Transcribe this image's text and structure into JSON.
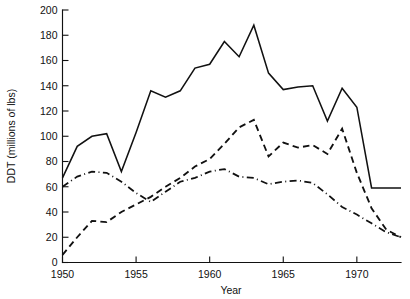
{
  "chart_data": {
    "type": "line",
    "title": "",
    "xlabel": "Year",
    "ylabel": "DDT (millions of lbs)",
    "xlim": [
      1950,
      1973
    ],
    "ylim": [
      0,
      200
    ],
    "grid": false,
    "legend_position": "none",
    "x_ticks": [
      1950,
      1955,
      1960,
      1965,
      1970
    ],
    "x_tick_labels": [
      "1950",
      "1955",
      "1960",
      "1965",
      "1970"
    ],
    "y_ticks": [
      0,
      20,
      40,
      60,
      80,
      100,
      120,
      140,
      160,
      180,
      200
    ],
    "y_tick_labels": [
      "0",
      "20",
      "40",
      "60",
      "80",
      "100",
      "120",
      "140",
      "160",
      "180",
      "200"
    ],
    "x": [
      1950,
      1951,
      1952,
      1953,
      1954,
      1955,
      1956,
      1957,
      1958,
      1959,
      1960,
      1961,
      1962,
      1963,
      1964,
      1965,
      1966,
      1967,
      1968,
      1969,
      1970,
      1971,
      1972,
      1973
    ],
    "series": [
      {
        "name": "Total production",
        "style": "solid",
        "values": [
          67,
          92,
          100,
          102,
          72,
          103,
          136,
          131,
          136,
          154,
          157,
          175,
          163,
          188,
          150,
          137,
          139,
          140,
          112,
          138,
          123,
          59,
          59,
          59
        ]
      },
      {
        "name": "Exports",
        "style": "dashed",
        "values": [
          6,
          20,
          33,
          32,
          40,
          46,
          52,
          60,
          67,
          76,
          82,
          94,
          107,
          113,
          84,
          95,
          91,
          93,
          86,
          106,
          71,
          43,
          26,
          20
        ]
      },
      {
        "name": "Domestic use",
        "style": "dash-dot",
        "values": [
          60,
          68,
          72,
          71,
          64,
          55,
          48,
          56,
          64,
          67,
          72,
          74,
          68,
          67,
          62,
          64,
          65,
          63,
          54,
          44,
          38,
          31,
          24,
          20
        ]
      }
    ]
  },
  "axes": {
    "y_axis_title": "DDT (millions of lbs)",
    "x_axis_title": "Year"
  }
}
